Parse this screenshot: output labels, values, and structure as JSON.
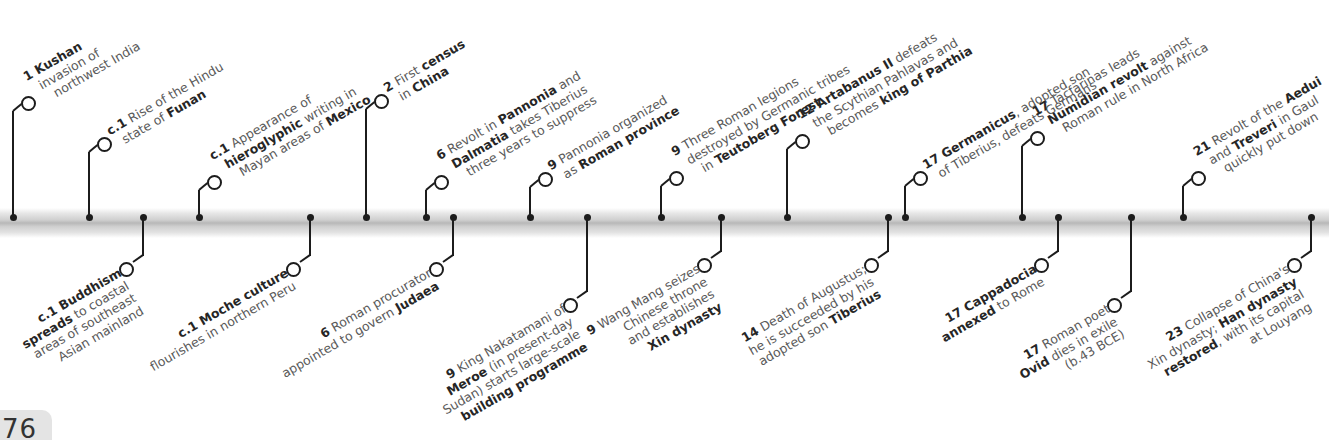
{
  "page": {
    "number": "76"
  },
  "timeline": {
    "bar_color": "#bdbdbd",
    "pin_color": "#1c1c1c",
    "up_events": [
      {
        "year": "1",
        "lines": [
          [
            [
              "b",
              "1 Kushan"
            ]
          ],
          [
            [
              "n",
              "invasion of"
            ]
          ],
          [
            [
              "n",
              "northwest India"
            ]
          ]
        ]
      },
      {
        "year": "c.1",
        "lines": [
          [
            [
              "b",
              "c.1"
            ],
            [
              "n",
              " Rise of the Hindu"
            ]
          ],
          [
            [
              "n",
              "state of "
            ],
            [
              "b",
              "Funan"
            ]
          ]
        ]
      },
      {
        "year": "c.1",
        "lines": [
          [
            [
              "b",
              "c.1"
            ],
            [
              "n",
              " Appearance of"
            ]
          ],
          [
            [
              "b",
              "hieroglyphic"
            ],
            [
              "n",
              " writing in"
            ]
          ],
          [
            [
              "n",
              "Mayan areas of "
            ],
            [
              "b",
              "Mexico"
            ]
          ]
        ]
      },
      {
        "year": "2",
        "lines": [
          [
            [
              "b",
              "2"
            ],
            [
              "n",
              " First "
            ],
            [
              "b",
              "census"
            ]
          ],
          [
            [
              "n",
              "in "
            ],
            [
              "b",
              "China"
            ]
          ]
        ]
      },
      {
        "year": "6",
        "lines": [
          [
            [
              "b",
              "6"
            ],
            [
              "n",
              " Revolt in "
            ],
            [
              "b",
              "Pannonia"
            ],
            [
              "n",
              " and"
            ]
          ],
          [
            [
              "b",
              "Dalmatia"
            ],
            [
              "n",
              " takes Tiberius"
            ]
          ],
          [
            [
              "n",
              "three years to suppress"
            ]
          ]
        ]
      },
      {
        "year": "9",
        "lines": [
          [
            [
              "b",
              "9"
            ],
            [
              "n",
              " Pannonia organized"
            ]
          ],
          [
            [
              "n",
              "as "
            ],
            [
              "b",
              "Roman province"
            ]
          ]
        ]
      },
      {
        "year": "9",
        "lines": [
          [
            [
              "b",
              "9"
            ],
            [
              "n",
              " Three Roman legions"
            ]
          ],
          [
            [
              "n",
              "destroyed by Germanic tribes"
            ]
          ],
          [
            [
              "n",
              "in "
            ],
            [
              "b",
              "Teutoberg Forest"
            ]
          ]
        ]
      },
      {
        "year": "12",
        "lines": [
          [
            [
              "b",
              "12 Artabanus II"
            ],
            [
              "n",
              " defeats"
            ]
          ],
          [
            [
              "n",
              "the Scythian Pahlavas and"
            ]
          ],
          [
            [
              "n",
              "becomes "
            ],
            [
              "b",
              "king of Parthia"
            ]
          ]
        ]
      },
      {
        "year": "17",
        "lines": [
          [
            [
              "b",
              "17 Germanicus"
            ],
            [
              "n",
              ", adopted son"
            ]
          ],
          [
            [
              "n",
              "of Tiberius, defeats Germans"
            ]
          ]
        ]
      },
      {
        "year": "17",
        "lines": [
          [
            [
              "b",
              "17"
            ],
            [
              "n",
              " Tacfarinas leads"
            ]
          ],
          [
            [
              "b",
              "Numidian revolt"
            ],
            [
              "n",
              " against"
            ]
          ],
          [
            [
              "n",
              "Roman rule in North Africa"
            ]
          ]
        ]
      },
      {
        "year": "21",
        "lines": [
          [
            [
              "b",
              "21"
            ],
            [
              "n",
              " Revolt of the "
            ],
            [
              "b",
              "Aedui"
            ]
          ],
          [
            [
              "n",
              "and "
            ],
            [
              "b",
              "Treveri"
            ],
            [
              "n",
              " in Gaul"
            ]
          ],
          [
            [
              "n",
              "quickly put down"
            ]
          ]
        ]
      }
    ],
    "down_events": [
      {
        "year": "c.1",
        "lines": [
          [
            [
              "b",
              "c.1 Buddhism"
            ]
          ],
          [
            [
              "b",
              "spreads"
            ],
            [
              "n",
              " to coastal"
            ]
          ],
          [
            [
              "n",
              "areas of southeast"
            ]
          ],
          [
            [
              "n",
              "Asian mainland"
            ]
          ]
        ]
      },
      {
        "year": "c.1",
        "lines": [
          [
            [
              "b",
              "c.1 Moche culture"
            ]
          ],
          [
            [
              "n",
              "flourishes in northern Peru"
            ]
          ]
        ]
      },
      {
        "year": "6",
        "lines": [
          [
            [
              "b",
              "6"
            ],
            [
              "n",
              " Roman procurator"
            ]
          ],
          [
            [
              "n",
              "appointed to govern "
            ],
            [
              "b",
              "Judaea"
            ]
          ]
        ]
      },
      {
        "year": "9",
        "lines": [
          [
            [
              "b",
              "9"
            ],
            [
              "n",
              " King Nakatamani of"
            ]
          ],
          [
            [
              "b",
              "Meroe"
            ],
            [
              "n",
              " (in present-day"
            ]
          ],
          [
            [
              "n",
              "Sudan) starts large-scale"
            ]
          ],
          [
            [
              "b",
              "building programme"
            ]
          ]
        ]
      },
      {
        "year": "9",
        "lines": [
          [
            [
              "b",
              "9"
            ],
            [
              "n",
              " Wang Mang seizes"
            ]
          ],
          [
            [
              "n",
              "Chinese throne"
            ]
          ],
          [
            [
              "n",
              "and establishes"
            ]
          ],
          [
            [
              "b",
              "Xin dynasty"
            ]
          ]
        ]
      },
      {
        "year": "14",
        "lines": [
          [
            [
              "b",
              "14"
            ],
            [
              "n",
              " Death of Augustus;"
            ]
          ],
          [
            [
              "n",
              "he is succeeded by his"
            ]
          ],
          [
            [
              "n",
              "adopted son "
            ],
            [
              "b",
              "Tiberius"
            ]
          ]
        ]
      },
      {
        "year": "17",
        "lines": [
          [
            [
              "b",
              "17 Cappadocia"
            ]
          ],
          [
            [
              "b",
              "annexed"
            ],
            [
              "n",
              " to Rome"
            ]
          ]
        ]
      },
      {
        "year": "17",
        "lines": [
          [
            [
              "b",
              "17"
            ],
            [
              "n",
              " Roman poet"
            ]
          ],
          [
            [
              "b",
              "Ovid"
            ],
            [
              "n",
              " dies in exile"
            ]
          ],
          [
            [
              "n",
              "(b.43 BCE)"
            ]
          ]
        ]
      },
      {
        "year": "23",
        "lines": [
          [
            [
              "b",
              "23"
            ],
            [
              "n",
              " Collapse of China's"
            ]
          ],
          [
            [
              "n",
              "Xin dynasty; "
            ],
            [
              "b",
              "Han dynasty"
            ]
          ],
          [
            [
              "b",
              "restored"
            ],
            [
              "n",
              ", with its capital"
            ]
          ],
          [
            [
              "n",
              "at Louyang"
            ]
          ]
        ]
      }
    ]
  }
}
